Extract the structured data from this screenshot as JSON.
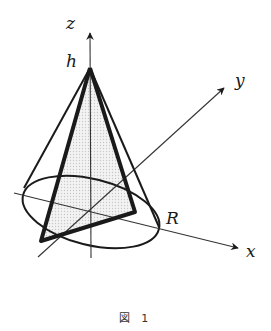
{
  "figure": {
    "caption": "図 1",
    "labels": {
      "z": "z",
      "y": "y",
      "x": "x",
      "h": "h",
      "R": "R"
    },
    "colors": {
      "line": "#1a1a1a",
      "axis": "#333333",
      "shade": "#e6e6e6"
    }
  }
}
